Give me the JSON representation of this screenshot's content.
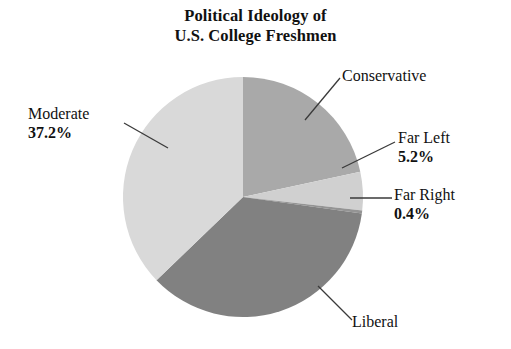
{
  "title": {
    "line1": "Political Ideology of",
    "line2": "U.S. College Freshmen"
  },
  "labels": {
    "conservative": {
      "name": "Conservative",
      "pct": ""
    },
    "far_left": {
      "name": "Far Left",
      "pct": "5.2%"
    },
    "far_right": {
      "name": "Far Right",
      "pct": "0.4%"
    },
    "liberal": {
      "name": "Liberal",
      "pct": ""
    },
    "moderate": {
      "name": "Moderate",
      "pct": "37.2%"
    }
  },
  "colors": {
    "moderate": "#d9d9d9",
    "conservative": "#a9a9a9",
    "liberal": "#818181",
    "far_left": "#d0d0d0",
    "far_right": "#949494",
    "leader_line": "#3a3a3a",
    "text": "#111111",
    "background": "#ffffff"
  },
  "chart_data": {
    "type": "pie",
    "title": "Political Ideology of U.S. College Freshmen",
    "xlabel": "",
    "ylabel": "",
    "units": "percent",
    "legend_position": "callout-labels",
    "grid": false,
    "start_angle_deg": 0,
    "direction": "clockwise",
    "center": {
      "x": 243,
      "y": 197
    },
    "radius": 120,
    "categories": [
      "Conservative",
      "Far Left",
      "Far Right",
      "Liberal",
      "Moderate"
    ],
    "values": [
      21.6,
      5.2,
      0.4,
      35.6,
      37.2
    ],
    "slices": [
      {
        "label": "Conservative",
        "value": 21.6,
        "displayed_pct": "",
        "color": "#a9a9a9",
        "start_deg": 0,
        "end_deg": 77.8
      },
      {
        "label": "Far Left",
        "value": 5.2,
        "displayed_pct": "5.2%",
        "color": "#d0d0d0",
        "start_deg": 77.8,
        "end_deg": 96.5
      },
      {
        "label": "Far Right",
        "value": 0.4,
        "displayed_pct": "0.4%",
        "color": "#949494",
        "start_deg": 96.5,
        "end_deg": 97.9
      },
      {
        "label": "Liberal",
        "value": 35.6,
        "displayed_pct": "",
        "color": "#818181",
        "start_deg": 97.9,
        "end_deg": 226.1
      },
      {
        "label": "Moderate",
        "value": 37.2,
        "displayed_pct": "37.2%",
        "color": "#d9d9d9",
        "start_deg": 226.1,
        "end_deg": 360
      }
    ]
  }
}
